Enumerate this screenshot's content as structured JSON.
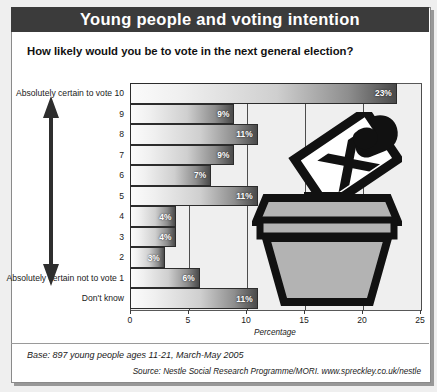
{
  "header": {
    "title": "Young people and voting intention"
  },
  "question": "How likely would you be to vote in the next general election?",
  "footer": {
    "base": "Base: 897 young people ages 11-21, March-May 2005",
    "source": "Source: Nestle Social Research Programme/MORI. www.spreckley.co.uk/nestle"
  },
  "axis": {
    "x_title": "Percentage",
    "x_ticks": [
      "0",
      "5",
      "10",
      "15",
      "20",
      "25"
    ]
  },
  "arrow": {
    "top_meaning": "Absolutely certain to vote 10",
    "bottom_meaning": "Absolutely certain not to vote 1"
  },
  "colors": {
    "title_bar": "#3b3b3b",
    "plot_bg": "#efefef",
    "bar_light": "#fbfbfb",
    "bar_dark": "#4a4a4a",
    "frame": "#8a8a8a"
  },
  "chart_data": {
    "type": "bar",
    "title": "Young people and voting intention",
    "subtitle": "How likely would you be to vote in the next general election?",
    "orientation": "horizontal",
    "xlabel": "Percentage",
    "ylabel": "",
    "xlim": [
      0,
      25
    ],
    "grid": true,
    "legend": null,
    "categories": [
      "Absolutely certain to vote 10",
      "9",
      "8",
      "7",
      "6",
      "5",
      "4",
      "3",
      "2",
      "Absolutely certain not to vote 1",
      "Don't know"
    ],
    "values": [
      23,
      9,
      11,
      9,
      7,
      11,
      4,
      4,
      3,
      6,
      11
    ],
    "data_labels": [
      "23%",
      "9%",
      "11%",
      "9%",
      "7%",
      "11%",
      "4%",
      "4%",
      "3%",
      "6%",
      "11%"
    ],
    "annotations": [
      "Base: 897 young people ages 11-21, March-May 2005",
      "Source: Nestle Social Research Programme/MORI. www.spreckley.co.uk/nestle"
    ]
  }
}
